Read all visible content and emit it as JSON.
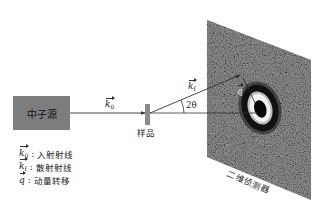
{
  "diagram": {
    "source": {
      "label": "中子源",
      "fill": "#7d7d7d"
    },
    "incident_beam": {
      "symbol": "k",
      "subscript": "0"
    },
    "sample": {
      "label": "样品",
      "fill": "#8a8a8a"
    },
    "scattered_beam": {
      "symbol": "k",
      "subscript": "f"
    },
    "angle_label": "2θ",
    "momentum_transfer": {
      "symbol": "q"
    },
    "detector": {
      "label": "二维侦测器",
      "fill": "#5e5e5e"
    },
    "legend": [
      {
        "symbol": "k",
        "subscript": "0",
        "text": "入射射线"
      },
      {
        "symbol": "k",
        "subscript": "f",
        "text": "散射射线"
      },
      {
        "symbol": "q",
        "subscript": "",
        "text": "动量转移"
      }
    ]
  }
}
